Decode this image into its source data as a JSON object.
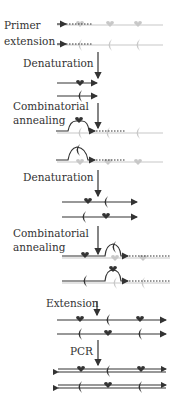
{
  "colors": {
    "dark": "#333333",
    "light": "#c8c8c8",
    "background": "#ffffff"
  },
  "labels": {
    "primer_extension_1": "Primer",
    "primer_extension_2": "extension",
    "denaturation_1": "Denaturation",
    "combinatorial_annealing_1a": "Combinatorial",
    "combinatorial_annealing_1b": "annealing",
    "denaturation_2": "Denaturation",
    "combinatorial_annealing_2a": "Combinatorial",
    "combinatorial_annealing_2b": "annealing",
    "extension": "Extension",
    "pcr": "PCR"
  },
  "steps": [
    {
      "name": "Primer extension",
      "motifs": [
        "heart",
        "crescent"
      ]
    },
    {
      "name": "Denaturation"
    },
    {
      "name": "Combinatorial annealing"
    },
    {
      "name": "Denaturation"
    },
    {
      "name": "Combinatorial annealing"
    },
    {
      "name": "Extension"
    },
    {
      "name": "PCR"
    }
  ]
}
